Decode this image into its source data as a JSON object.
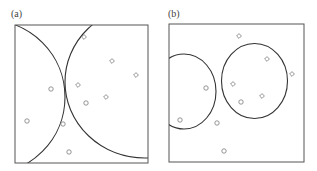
{
  "figure": {
    "panels": [
      {
        "id": "a",
        "label": "(a)",
        "label_pos": [
          11,
          8
        ],
        "box": {
          "x": 15,
          "y": 25,
          "w": 133,
          "h": 138
        },
        "boundaries": [
          {
            "type": "circle",
            "cx": -12,
            "cy": 97,
            "rx": 77,
            "ry": 77
          },
          {
            "type": "circle",
            "cx": 145,
            "cy": 82,
            "rx": 80,
            "ry": 76
          }
        ],
        "points": [
          {
            "shape": "diamond",
            "x": 84,
            "y": 37
          },
          {
            "shape": "diamond",
            "x": 112,
            "y": 61
          },
          {
            "shape": "diamond",
            "x": 136,
            "y": 75
          },
          {
            "shape": "diamond",
            "x": 78,
            "y": 85
          },
          {
            "shape": "diamond",
            "x": 106,
            "y": 97
          },
          {
            "shape": "circle",
            "x": 51,
            "y": 89
          },
          {
            "shape": "circle",
            "x": 86,
            "y": 103
          },
          {
            "shape": "circle",
            "x": 27,
            "y": 121
          },
          {
            "shape": "circle",
            "x": 63,
            "y": 124
          },
          {
            "shape": "circle",
            "x": 69,
            "y": 152
          }
        ]
      },
      {
        "id": "b",
        "label": "(b)",
        "label_pos": [
          168,
          8
        ],
        "box": {
          "x": 169,
          "y": 24,
          "w": 135,
          "h": 138
        },
        "boundaries": [
          {
            "type": "ellipse",
            "cx": 184,
            "cy": 91.5,
            "rx": 32,
            "ry": 37.5
          },
          {
            "type": "ellipse",
            "cx": 254.5,
            "cy": 81,
            "rx": 33,
            "ry": 37.5
          }
        ],
        "points": [
          {
            "shape": "diamond",
            "x": 239,
            "y": 36
          },
          {
            "shape": "diamond",
            "x": 267,
            "y": 59
          },
          {
            "shape": "diamond",
            "x": 292,
            "y": 74
          },
          {
            "shape": "diamond",
            "x": 233,
            "y": 84
          },
          {
            "shape": "diamond",
            "x": 262,
            "y": 96
          },
          {
            "shape": "circle",
            "x": 206,
            "y": 88
          },
          {
            "shape": "circle",
            "x": 241,
            "y": 102
          },
          {
            "shape": "circle",
            "x": 180,
            "y": 120
          },
          {
            "shape": "circle",
            "x": 217,
            "y": 123
          },
          {
            "shape": "circle",
            "x": 224,
            "y": 151
          }
        ]
      }
    ],
    "colors": {
      "frame": "#555555",
      "boundary": "#333333",
      "marker": "#888888"
    }
  }
}
